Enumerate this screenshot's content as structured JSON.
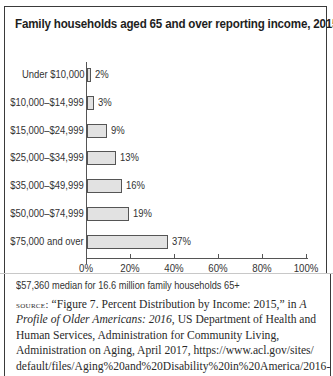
{
  "title": "Family households aged 65 and over reporting income, 2015",
  "chart_data": {
    "type": "bar",
    "orientation": "horizontal",
    "title": "Family households aged 65 and over reporting income, 2015",
    "categories": [
      "Under $10,000",
      "$10,000–$14,999",
      "$15,000–$24,999",
      "$25,000–$34,999",
      "$35,000–$49,999",
      "$50,000–$74,999",
      "$75,000 and over"
    ],
    "values": [
      2,
      3,
      9,
      13,
      16,
      19,
      37
    ],
    "value_labels": [
      "2%",
      "3%",
      "9%",
      "13%",
      "16%",
      "19%",
      "37%"
    ],
    "xlabel": "",
    "ylabel": "",
    "xlim": [
      0,
      100
    ],
    "x_ticks": [
      "0%",
      "20%",
      "40%",
      "60%",
      "80%",
      "100%"
    ],
    "grid": false,
    "legend": null,
    "bar_color": "#e2e2e2"
  },
  "note": "$57,360 median for 16.6 million family households 65+",
  "source": {
    "label": "source:",
    "text_1": " “Figure 7. Percent Distribution by Income: 2015,” in ",
    "italic": "A Profile of Older Americans: 2016",
    "text_2": ", US Department of Health and Human Services, Administration for Community Living, Administration on Aging, April 2017, https://www.acl.gov/sites/ default/files/Aging%20and%20Disability%20in%20America/2016-Profile.pdf (accessed October 13, 2017)"
  }
}
